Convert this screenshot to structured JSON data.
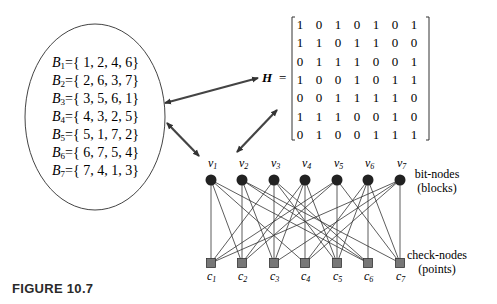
{
  "blocks": {
    "sets": [
      {
        "name": "B",
        "index": "1",
        "elements": "{ 1, 2, 4, 6}",
        "members": [
          1,
          2,
          4,
          6
        ]
      },
      {
        "name": "B",
        "index": "2",
        "elements": "{ 2, 6, 3, 7}",
        "members": [
          2,
          6,
          3,
          7
        ]
      },
      {
        "name": "B",
        "index": "3",
        "elements": "{ 3, 5, 6, 1}",
        "members": [
          3,
          5,
          6,
          1
        ]
      },
      {
        "name": "B",
        "index": "4",
        "elements": "{ 4, 3, 2, 5}",
        "members": [
          4,
          3,
          2,
          5
        ]
      },
      {
        "name": "B",
        "index": "5",
        "elements": "{ 5, 1, 7, 2}",
        "members": [
          5,
          1,
          7,
          2
        ]
      },
      {
        "name": "B",
        "index": "6",
        "elements": "{ 6, 7, 5, 4}",
        "members": [
          6,
          7,
          5,
          4
        ]
      },
      {
        "name": "B",
        "index": "7",
        "elements": "{ 7, 4, 1, 3}",
        "members": [
          7,
          4,
          1,
          3
        ]
      }
    ]
  },
  "matrix": {
    "label": "H",
    "equals": "=",
    "rows": [
      [
        1,
        0,
        1,
        0,
        1,
        0,
        1
      ],
      [
        1,
        1,
        0,
        1,
        1,
        0,
        0
      ],
      [
        0,
        1,
        1,
        1,
        0,
        0,
        1
      ],
      [
        1,
        0,
        0,
        1,
        0,
        1,
        1
      ],
      [
        0,
        0,
        1,
        1,
        1,
        1,
        0
      ],
      [
        1,
        1,
        1,
        0,
        0,
        1,
        0
      ],
      [
        0,
        1,
        0,
        0,
        1,
        1,
        1
      ]
    ]
  },
  "graph": {
    "bit_nodes": [
      "v1",
      "v2",
      "v3",
      "v4",
      "v5",
      "v6",
      "v7"
    ],
    "check_nodes": [
      "c1",
      "c2",
      "c3",
      "c4",
      "c5",
      "c6",
      "c7"
    ],
    "bit_label": "bit-nodes",
    "bit_sublabel": "(blocks)",
    "check_label": "check-nodes",
    "check_sublabel": "(points)"
  },
  "caption": "FIGURE 10.7"
}
